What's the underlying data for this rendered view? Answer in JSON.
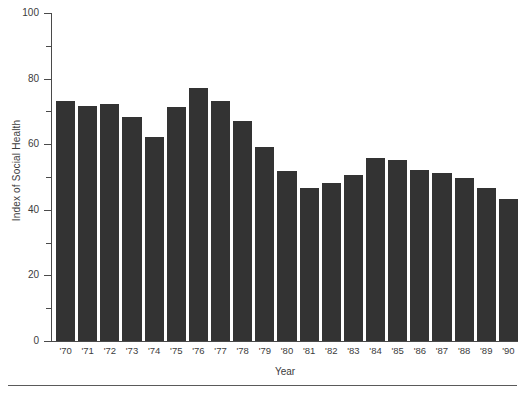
{
  "chart_data": {
    "type": "bar",
    "title": "",
    "xlabel": "Year",
    "ylabel": "Index of Social Health",
    "categories": [
      "'70",
      "'71",
      "'72",
      "'73",
      "'74",
      "'75",
      "'76",
      "'77",
      "'78",
      "'79",
      "'80",
      "'81",
      "'82",
      "'83",
      "'84",
      "'85",
      "'86",
      "'87",
      "'88",
      "'89",
      "'90"
    ],
    "values": [
      73.5,
      72.0,
      72.5,
      68.5,
      62.5,
      71.5,
      77.5,
      73.5,
      67.5,
      59.5,
      52.0,
      47.0,
      48.5,
      51.0,
      56.0,
      55.5,
      52.5,
      51.5,
      50.0,
      47.0,
      43.5
    ],
    "ylim": [
      0,
      100
    ],
    "y_major_ticks": [
      0,
      20,
      40,
      60,
      80,
      100
    ],
    "y_minor_ticks": [
      10,
      30,
      50,
      70,
      90
    ],
    "y_tick_labels": [
      "0",
      "20",
      "40",
      "60",
      "80",
      "100"
    ],
    "grid": false,
    "legend": false,
    "bar_color": "#333333",
    "axis_color": "#4a4a4a",
    "text_color": "#3c3c3c",
    "background_color": "#ffffff"
  }
}
